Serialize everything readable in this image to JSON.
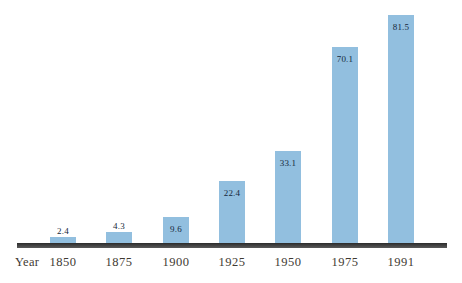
{
  "chart_data": {
    "type": "bar",
    "title": "",
    "xlabel": "Year",
    "ylabel": "",
    "categories": [
      "1850",
      "1875",
      "1900",
      "1925",
      "1950",
      "1975",
      "1991"
    ],
    "values": [
      2.4,
      4.3,
      9.6,
      22.4,
      33.1,
      70.1,
      81.5
    ],
    "value_labels": [
      "2.4",
      "4.3",
      "9.6",
      "22.4",
      "33.1",
      "70.1",
      "81.5"
    ],
    "value_label_placement": [
      "above",
      "above",
      "inside",
      "inside",
      "inside",
      "inside",
      "inside"
    ],
    "ylim": [
      0,
      87
    ],
    "grid": false,
    "legend": null,
    "bar_color": "#92bfdf",
    "axis_line_color": "#3a3a3a",
    "value_text_color": "#16283c",
    "tick_text_color": "#3f3a33",
    "background": "#ffffff"
  }
}
